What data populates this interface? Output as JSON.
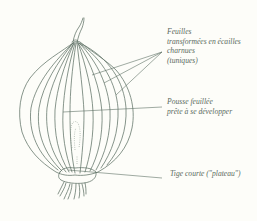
{
  "figure": {
    "line_color": "#5f7266",
    "text_color": "#5a6a5e",
    "background": "#fdfdf9"
  },
  "labels": {
    "feuilles": {
      "lines": [
        "Feuilles",
        "transformées en écailles",
        "charnues",
        "(tuniques)"
      ]
    },
    "pousse": {
      "lines": [
        "Pousse feuillée",
        "prête à se développer"
      ]
    },
    "tige": {
      "lines": [
        "Tige courte (\"plateau\")"
      ]
    }
  }
}
